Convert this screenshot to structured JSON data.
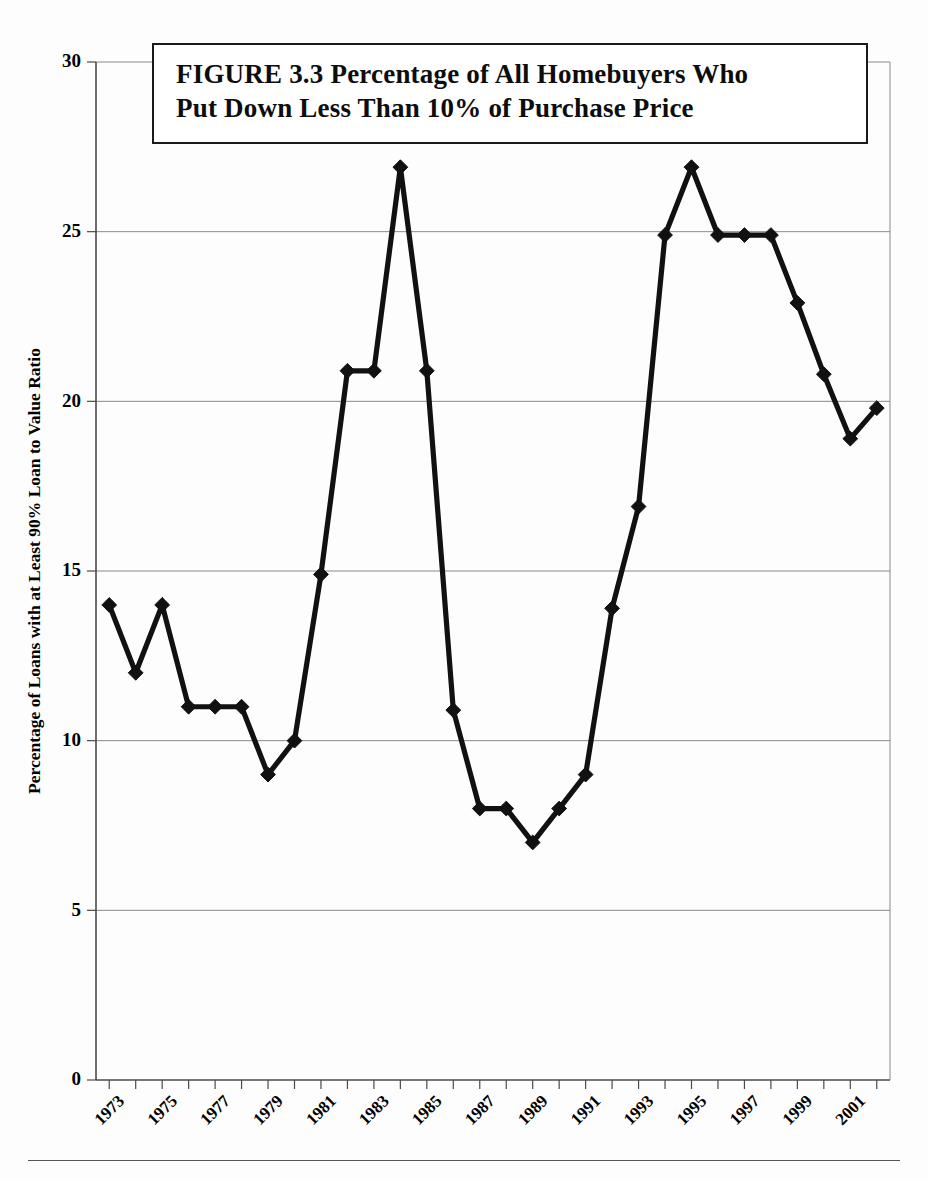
{
  "figure": {
    "title_line1": "FIGURE 3.3  Percentage of All Homebuyers Who",
    "title_line2": "Put Down Less Than 10% of Purchase Price"
  },
  "chart_data": {
    "type": "line",
    "title": "FIGURE 3.3  Percentage of All Homebuyers Who Put Down Less Than 10% of Purchase Price",
    "xlabel": "",
    "ylabel": "Percentage of Loans with at Least 90% Loan to Value Ratio",
    "ylim": [
      0,
      30
    ],
    "xlim": [
      1972.5,
      2002.5
    ],
    "yticks": [
      0,
      5,
      10,
      15,
      20,
      25,
      30
    ],
    "ytick_labels": [
      "0",
      "5",
      "10",
      "15",
      "20",
      "25",
      "30"
    ],
    "grid": "horizontal",
    "legend": "none",
    "marker": "diamond",
    "x": [
      1973,
      1974,
      1975,
      1976,
      1977,
      1978,
      1979,
      1980,
      1981,
      1982,
      1983,
      1984,
      1985,
      1986,
      1987,
      1988,
      1989,
      1990,
      1991,
      1992,
      1993,
      1994,
      1995,
      1996,
      1997,
      1998,
      1999,
      2000,
      2001,
      2002
    ],
    "xtick_labels": [
      "1973",
      "",
      "1975",
      "",
      "1977",
      "",
      "1979",
      "",
      "1981",
      "",
      "1983",
      "",
      "1985",
      "",
      "1987",
      "",
      "1989",
      "",
      "1991",
      "",
      "1993",
      "",
      "1995",
      "",
      "1997",
      "",
      "1999",
      "",
      "2001",
      ""
    ],
    "series": [
      {
        "name": "Percentage of Loans with at Least 90% Loan to Value Ratio",
        "color": "#111111",
        "values": [
          14.0,
          12.0,
          14.0,
          11.0,
          11.0,
          11.0,
          9.0,
          10.0,
          14.9,
          20.9,
          20.9,
          26.9,
          20.9,
          10.9,
          8.0,
          8.0,
          7.0,
          8.0,
          9.0,
          13.9,
          16.9,
          24.9,
          26.9,
          24.9,
          24.9,
          24.9,
          22.9,
          20.8,
          18.9,
          19.8
        ]
      }
    ]
  }
}
